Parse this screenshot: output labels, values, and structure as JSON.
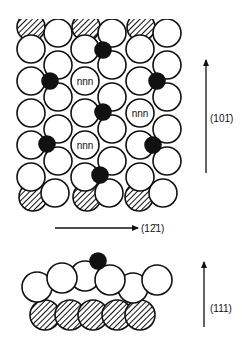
{
  "figure": {
    "colors": {
      "background": "#ffffff",
      "stroke": "#111111",
      "adatom": "#111111",
      "hatch": "#111111"
    },
    "top_view": {
      "radius": 14,
      "hatched_top": [
        [
          31,
          27
        ],
        [
          86,
          27
        ],
        [
          141,
          27
        ]
      ],
      "hatched_bottom": [
        [
          33,
          197
        ],
        [
          87,
          197
        ],
        [
          139,
          197
        ]
      ],
      "surface_atoms": [
        [
          58,
          33
        ],
        [
          112,
          33
        ],
        [
          167,
          33
        ],
        [
          31,
          49
        ],
        [
          85,
          49
        ],
        [
          140,
          49
        ],
        [
          58,
          65
        ],
        [
          112,
          65
        ],
        [
          167,
          65
        ],
        [
          31,
          81
        ],
        [
          85,
          81
        ],
        [
          140,
          81
        ],
        [
          58,
          97
        ],
        [
          112,
          97
        ],
        [
          167,
          97
        ],
        [
          31,
          113
        ],
        [
          85,
          113
        ],
        [
          140,
          113
        ],
        [
          58,
          129
        ],
        [
          112,
          129
        ],
        [
          167,
          129
        ],
        [
          31,
          145
        ],
        [
          85,
          145
        ],
        [
          140,
          145
        ],
        [
          58,
          161
        ],
        [
          112,
          161
        ],
        [
          167,
          161
        ],
        [
          31,
          177
        ],
        [
          85,
          177
        ],
        [
          140,
          177
        ],
        [
          55,
          193
        ],
        [
          109,
          193
        ],
        [
          163,
          193
        ]
      ],
      "adatoms": [
        [
          103,
          50
        ],
        [
          50,
          81
        ],
        [
          157,
          81
        ],
        [
          103,
          112
        ],
        [
          47,
          144
        ],
        [
          153,
          145
        ],
        [
          100,
          175
        ]
      ],
      "adatom_radius": 8,
      "nnn_labels": [
        {
          "x": 85,
          "y": 81,
          "text": "nnn"
        },
        {
          "x": 140,
          "y": 113,
          "text": "nnn"
        },
        {
          "x": 85,
          "y": 145,
          "text": "nnn"
        }
      ]
    },
    "side_view": {
      "radius": 15,
      "hatched_layer": [
        [
          45,
          315
        ],
        [
          70,
          315
        ],
        [
          93,
          315
        ],
        [
          117,
          315
        ],
        [
          140,
          315
        ]
      ],
      "surface_layer": [
        [
          85,
          276
        ],
        [
          133,
          288
        ],
        [
          37,
          287
        ],
        [
          62,
          278
        ],
        [
          110,
          280
        ],
        [
          157,
          280
        ]
      ],
      "adatom": [
        98,
        261
      ],
      "adatom_radius": 8
    },
    "arrows": [
      {
        "name": "arrow-101bar",
        "x1": 206,
        "y1": 173,
        "x2": 206,
        "y2": 60,
        "label": "(101̄)",
        "lx": 210,
        "ly": 122
      },
      {
        "name": "arrow-12bar1",
        "x1": 55,
        "y1": 228,
        "x2": 138,
        "y2": 228,
        "label": "(12̄1)",
        "lx": 141,
        "ly": 232
      },
      {
        "name": "arrow-111",
        "x1": 204,
        "y1": 327,
        "x2": 204,
        "y2": 262,
        "label": "(111)",
        "lx": 210,
        "ly": 312
      }
    ]
  }
}
